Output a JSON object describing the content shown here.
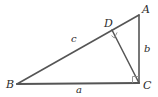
{
  "figure": {
    "type": "geometry-diagram",
    "background_color": "#ffffff",
    "stroke_color": "#555555",
    "label_color": "#2b2b2b",
    "width": 158,
    "height": 97,
    "vertices": [
      {
        "id": "A",
        "label": "A",
        "x": 139,
        "y": 15
      },
      {
        "id": "B",
        "label": "B",
        "x": 17,
        "y": 84
      },
      {
        "id": "C",
        "label": "C",
        "x": 139,
        "y": 83
      },
      {
        "id": "D",
        "label": "D",
        "x": 112,
        "y": 30
      }
    ],
    "segments": [
      {
        "id": "BA",
        "from": "B",
        "to": "A",
        "label": ""
      },
      {
        "id": "BC",
        "from": "B",
        "to": "C",
        "label": "a"
      },
      {
        "id": "AC",
        "from": "A",
        "to": "C",
        "label": "b"
      },
      {
        "id": "DC",
        "from": "D",
        "to": "C",
        "label": ""
      }
    ],
    "side_labels": [
      {
        "id": "a",
        "label": "a",
        "x": 79,
        "y": 90,
        "describes": "segment BC (base)"
      },
      {
        "id": "b",
        "label": "b",
        "x": 147,
        "y": 49,
        "describes": "segment AC (vertical leg)"
      },
      {
        "id": "c",
        "label": "c",
        "x": 74,
        "y": 39,
        "describes": "segment BD (along hypotenuse)"
      }
    ],
    "right_angles": [
      {
        "id": "right-angle-at-D",
        "at": "D",
        "between": [
          "DB",
          "DC"
        ]
      },
      {
        "id": "right-angle-at-C",
        "at": "C",
        "between": [
          "CB",
          "CA"
        ]
      }
    ]
  }
}
